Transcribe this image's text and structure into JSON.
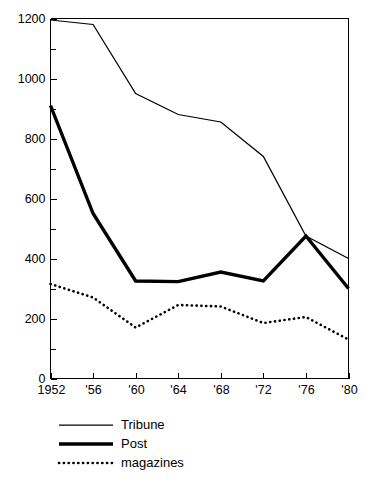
{
  "chart_data": {
    "type": "line",
    "title": "",
    "subtitle": "",
    "xlabel": "",
    "ylabel": "",
    "x": [
      1952,
      1956,
      1960,
      1964,
      1968,
      1972,
      1976,
      1980
    ],
    "categories": [
      "1952",
      "'56",
      "'60",
      "'64",
      "'68",
      "'72",
      "'76",
      "'80"
    ],
    "xlim": [
      1952,
      1980
    ],
    "ylim": [
      0,
      1200
    ],
    "y_tick_labels": [
      "0",
      "200",
      "400",
      "600",
      "800",
      "1000",
      "1200"
    ],
    "y_tick_values": [
      0,
      200,
      400,
      600,
      800,
      1000,
      1200
    ],
    "y_minor_tick_values": [
      100,
      300,
      500,
      700,
      900,
      1100
    ],
    "grid": false,
    "legend_position": "below-axes-left",
    "series": [
      {
        "name": "Tribune",
        "style": "thin-solid",
        "color": "#000000",
        "values": [
          1195,
          1180,
          950,
          880,
          855,
          740,
          475,
          400
        ]
      },
      {
        "name": "Post",
        "style": "thick-solid",
        "color": "#000000",
        "values": [
          910,
          550,
          325,
          323,
          355,
          325,
          475,
          300
        ]
      },
      {
        "name": "magazines",
        "style": "dotted",
        "color": "#000000",
        "values": [
          315,
          270,
          170,
          245,
          240,
          185,
          205,
          130
        ]
      }
    ]
  },
  "axes": {
    "y_labels": [
      {
        "text": "1200",
        "value": 1200
      },
      {
        "text": "1000",
        "value": 1000
      },
      {
        "text": "800",
        "value": 800
      },
      {
        "text": "600",
        "value": 600
      },
      {
        "text": "400",
        "value": 400
      },
      {
        "text": "200",
        "value": 200
      },
      {
        "text": "0",
        "value": 0
      }
    ],
    "x_labels": [
      {
        "text": "1952",
        "value": 1952
      },
      {
        "text": "'56",
        "value": 1956
      },
      {
        "text": "'60",
        "value": 1960
      },
      {
        "text": "'64",
        "value": 1964
      },
      {
        "text": "'68",
        "value": 1968
      },
      {
        "text": "'72",
        "value": 1972
      },
      {
        "text": "'76",
        "value": 1976
      },
      {
        "text": "'80",
        "value": 1980
      }
    ]
  },
  "legend": {
    "entries": [
      {
        "label": "Tribune",
        "style": "thin-solid"
      },
      {
        "label": "Post",
        "style": "thick-solid"
      },
      {
        "label": "magazines",
        "style": "dotted"
      }
    ]
  },
  "colors": {
    "ink": "#000000",
    "background": "#ffffff"
  }
}
